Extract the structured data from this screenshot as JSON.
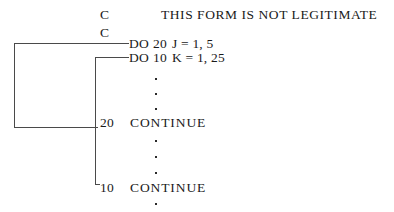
{
  "document": {
    "kind": "fortran-do-loop-nesting-diagram",
    "header_note": "THIS FORM IS NOT LEGITIMATE",
    "comment_lines": [
      {
        "mark": "C"
      },
      {
        "mark": "C"
      }
    ],
    "statements": [
      {
        "id": "do-20",
        "keyword": "DO",
        "target_label": "20",
        "control": "J = 1, 5"
      },
      {
        "id": "do-10",
        "keyword": "DO",
        "target_label": "10",
        "control": "K = 1, 25"
      },
      {
        "id": "continue-20",
        "label": "20",
        "statement": "CONTINUE"
      },
      {
        "id": "continue-10",
        "label": "10",
        "statement": "CONTINUE"
      }
    ],
    "ellipsis_groups": [
      {
        "id": "ellipsis-inner-body",
        "count": 3
      },
      {
        "id": "ellipsis-between-continues",
        "count": 3
      },
      {
        "id": "ellipsis-trailing",
        "count": 1
      }
    ],
    "brackets": [
      {
        "id": "outer-loop-bracket",
        "binds_from": "DO 20 J = 1, 5",
        "binds_to": "20 CONTINUE"
      },
      {
        "id": "inner-loop-bracket",
        "binds_from": "DO 10 K = 1, 25",
        "binds_to": "10 CONTINUE"
      }
    ],
    "colors": {
      "ink": "#1a1a1a",
      "rule": "#4a4a4a",
      "paper": "#ffffff"
    }
  }
}
